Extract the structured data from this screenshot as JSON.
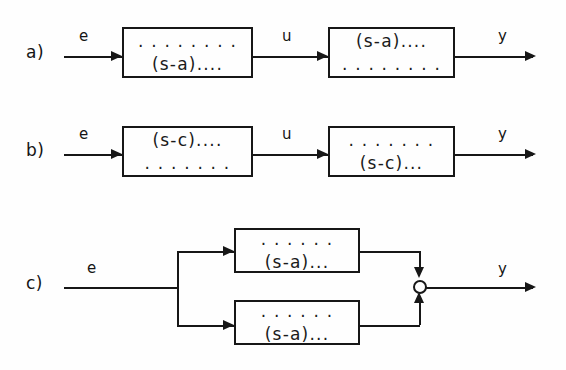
{
  "figure": {
    "type": "control-block-diagram",
    "background_color": "#fefefe",
    "line_color": "#171717"
  },
  "rows": [
    {
      "id": "a",
      "label": "a)",
      "input_label": "e",
      "middle_label": "u",
      "output_label": "y",
      "blocks": [
        {
          "id": "a-block-1",
          "numerator": ". . . . . . . .",
          "denominator": "(s-a)...."
        },
        {
          "id": "a-block-2",
          "numerator": "(s-a)....",
          "denominator": ". . . . . . . ."
        }
      ]
    },
    {
      "id": "b",
      "label": "b)",
      "input_label": "e",
      "middle_label": "u",
      "output_label": "y",
      "blocks": [
        {
          "id": "b-block-1",
          "numerator": "(s-c)....",
          "denominator": ". . . . . . ."
        },
        {
          "id": "b-block-2",
          "numerator": ". . . . . . .",
          "denominator": "(s-c)..."
        }
      ]
    },
    {
      "id": "c",
      "label": "c)",
      "input_label": "e",
      "output_label": "y",
      "summing_junction": "open-circle",
      "blocks": [
        {
          "id": "c-block-top",
          "numerator": ". . . . . .",
          "denominator": "(s-a)..."
        },
        {
          "id": "c-block-bottom",
          "numerator": ". . . . . .",
          "denominator": "(s-a)..."
        }
      ]
    }
  ]
}
